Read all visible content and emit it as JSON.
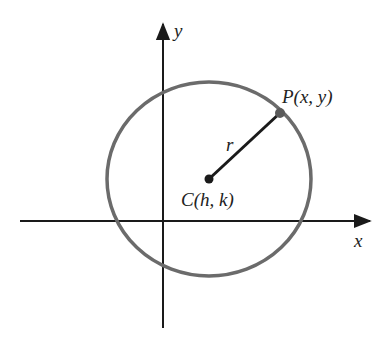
{
  "diagram": {
    "axes": {
      "x_label": "x",
      "y_label": "y"
    },
    "center_label": "C(h, k)",
    "point_label": "P(x, y)",
    "radius_label": "r",
    "colors": {
      "circle": "#6b6b6b",
      "axes": "#1a1a1a",
      "radius": "#1a1a1a",
      "center_dot": "#1a1a1a",
      "point_dot": "#5a5a5a"
    }
  }
}
